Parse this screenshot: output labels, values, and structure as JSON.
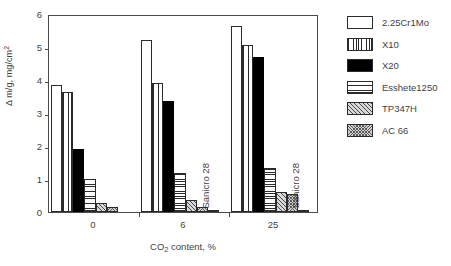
{
  "chart_data": {
    "type": "bar",
    "title": "",
    "xlabel": "CO2 content, %",
    "xlabel_parts": {
      "pre": "CO",
      "sub": "2",
      "post": " content, %"
    },
    "ylabel": "Δ m/g, mg/cm2",
    "ylabel_parts": {
      "pre": "Δ m/g, mg/cm",
      "sup": "2"
    },
    "categories": [
      "0",
      "6",
      "25"
    ],
    "xtick_labels": [
      "0",
      "6",
      "25"
    ],
    "ytick_labels": [
      "0",
      "1",
      "2",
      "3",
      "4",
      "5",
      "6"
    ],
    "ylim": [
      0,
      6
    ],
    "grid": false,
    "legend_position": "right",
    "series": [
      {
        "name": "2.25Cr1Mo",
        "pattern": "empty",
        "values": [
          3.86,
          5.22,
          5.65
        ]
      },
      {
        "name": "X10",
        "pattern": "vert",
        "values": [
          3.63,
          3.9,
          5.05
        ]
      },
      {
        "name": "X20",
        "pattern": "solid",
        "values": [
          1.91,
          3.35,
          4.7
        ]
      },
      {
        "name": "Esshete1250",
        "pattern": "horiz",
        "values": [
          0.99,
          1.17,
          1.33
        ]
      },
      {
        "name": "TP347H",
        "pattern": "diag",
        "values": [
          0.27,
          0.35,
          0.62
        ]
      },
      {
        "name": "AC 66",
        "pattern": "cross",
        "values": [
          0.16,
          0.14,
          0.55
        ]
      },
      {
        "name": "Sanicro 28",
        "pattern": "cross",
        "values": [
          0.0,
          0.06,
          0.05
        ]
      }
    ],
    "annotations": [
      {
        "text": "Sanicro 28",
        "group": "6",
        "series": "Sanicro 28",
        "rotation": -90
      },
      {
        "text": "Sanicro 28",
        "group": "25",
        "series": "Sanicro 28",
        "rotation": -90
      }
    ]
  },
  "legend": {
    "items": [
      {
        "label": "2.25Cr1Mo",
        "pattern": "empty"
      },
      {
        "label": "X10",
        "pattern": "vert"
      },
      {
        "label": "X20",
        "pattern": "solid"
      },
      {
        "label": "Esshete1250",
        "pattern": "horiz"
      },
      {
        "label": "TP347H",
        "pattern": "diag"
      },
      {
        "label": "AC 66",
        "pattern": "cross"
      }
    ]
  },
  "colors": {
    "axis": "#4b4b4b",
    "text": "#3f3f3f",
    "bar_outline": "#2b2b2b",
    "solid_fill": "#000000",
    "background": "#ffffff"
  }
}
